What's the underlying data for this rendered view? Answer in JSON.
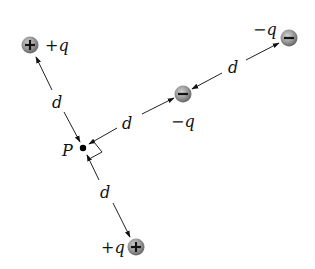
{
  "diagram": {
    "point": {
      "label": "P",
      "x": 83,
      "y": 148
    },
    "charges": [
      {
        "id": "top-left",
        "sign": "+",
        "label": "+q",
        "x": 30,
        "y": 45
      },
      {
        "id": "middle",
        "sign": "-",
        "label": "−q",
        "x": 183,
        "y": 94
      },
      {
        "id": "top-right",
        "sign": "-",
        "label": "−q",
        "x": 289,
        "y": 38
      },
      {
        "id": "bottom",
        "sign": "+",
        "label": "+q",
        "x": 136,
        "y": 247
      }
    ],
    "distances": [
      {
        "between": "P-top-left",
        "label": "d"
      },
      {
        "between": "P-middle",
        "label": "d"
      },
      {
        "between": "middle-top-right",
        "label": "d"
      },
      {
        "between": "P-bottom",
        "label": "d"
      }
    ],
    "right_angle_marker": true,
    "colors": {
      "charge_light": "#c8c8c8",
      "charge_dark": "#6a6a6a",
      "line": "#222222"
    }
  }
}
